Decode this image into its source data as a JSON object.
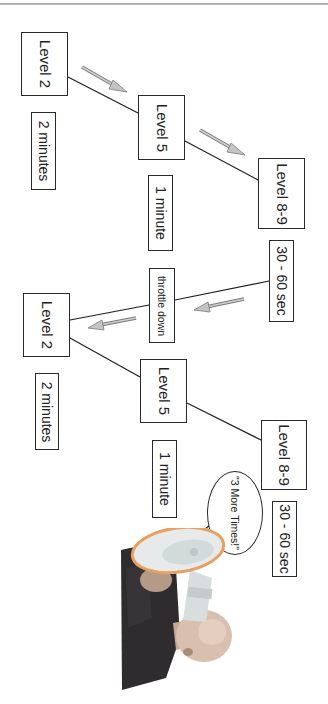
{
  "diagram": {
    "orientation": "rotated 90deg clockwise",
    "cycle_1": {
      "nodes": [
        {
          "label": "Level 2",
          "duration": "2 minutes"
        },
        {
          "label": "Level 5",
          "duration": "1 minute"
        },
        {
          "label": "Level 8-9",
          "duration": "30 - 60 sec"
        }
      ]
    },
    "transition": {
      "label": "throttle down"
    },
    "cycle_2": {
      "nodes": [
        {
          "label": "Level 2",
          "duration": "2 minutes"
        },
        {
          "label": "Level 5",
          "duration": "1 minute"
        },
        {
          "label": "Level 8-9",
          "duration": "30 - 60 sec"
        }
      ]
    },
    "speech_bubble": {
      "text": "\"3 More Times!\""
    },
    "illustration": {
      "subject": "man-with-megaphone-photo"
    }
  },
  "colors": {
    "line": "#1f1f1f",
    "arrow_fill": "#c4c4c4",
    "arrow_stroke": "#7a7a7a",
    "megaphone_rim": "#e8a060",
    "megaphone_body": "#dfe6e6"
  }
}
